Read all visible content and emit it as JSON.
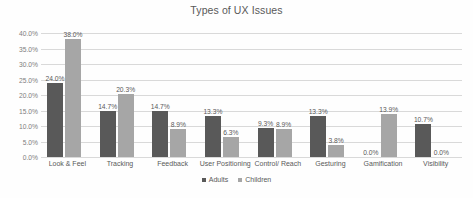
{
  "chart_data": {
    "type": "bar",
    "title": "Types of UX Issues",
    "xlabel": "",
    "ylabel": "",
    "ylim": [
      0,
      40
    ],
    "grid": true,
    "legend_position": "bottom",
    "categories": [
      "Look & Feel",
      "Tracking",
      "Feedback",
      "User Positioning",
      "Control/ Reach",
      "Gesturing",
      "Gamification",
      "Visibility"
    ],
    "ytick_labels": [
      "0.0%",
      "5.0%",
      "10.0%",
      "15.0%",
      "20.0%",
      "25.0%",
      "30.0%",
      "35.0%",
      "40.0%"
    ],
    "ytick_values": [
      0,
      5,
      10,
      15,
      20,
      25,
      30,
      35,
      40
    ],
    "series": [
      {
        "name": "Adults",
        "color": "#595959",
        "values": [
          24.0,
          14.7,
          14.7,
          13.3,
          9.3,
          13.3,
          0.0,
          10.7
        ],
        "labels": [
          "24.0%",
          "14.7%",
          "14.7%",
          "13.3%",
          "9.3%",
          "13.3%",
          "0.0%",
          "10.7%"
        ]
      },
      {
        "name": "Children",
        "color": "#a6a6a6",
        "values": [
          38.0,
          20.3,
          8.9,
          6.3,
          8.9,
          3.8,
          13.9,
          0.0
        ],
        "labels": [
          "38.0%",
          "20.3%",
          "8.9%",
          "6.3%",
          "8.9%",
          "3.8%",
          "13.9%",
          "0.0%"
        ]
      }
    ]
  }
}
